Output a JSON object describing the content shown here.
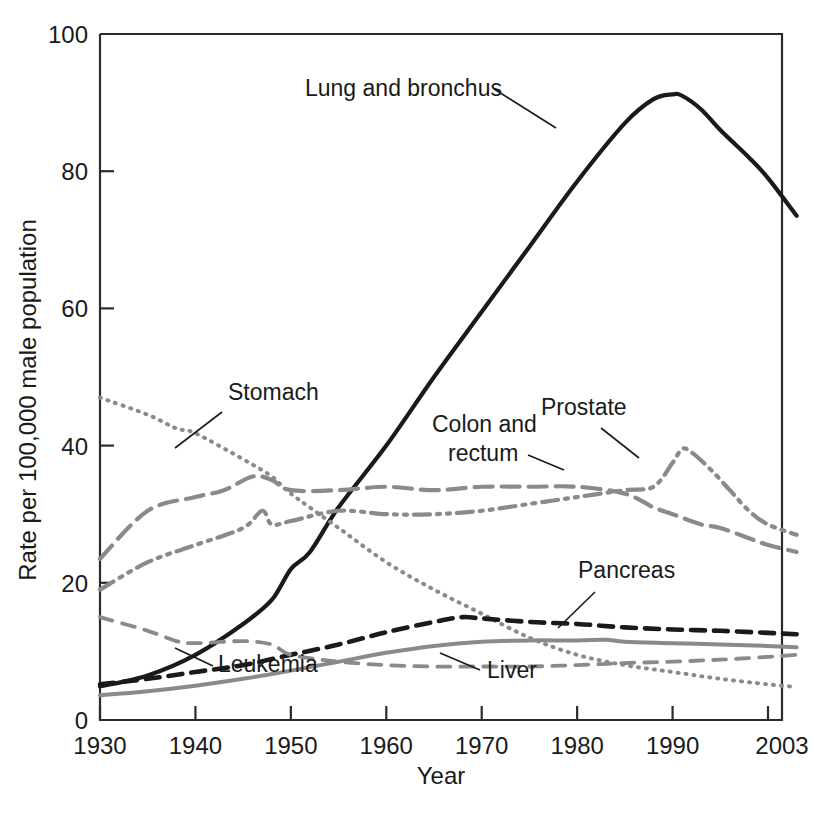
{
  "chart_data": {
    "type": "line",
    "title": "",
    "xlabel": "Year",
    "ylabel": "Rate per 100,000 male population",
    "xlim": [
      1930,
      2003
    ],
    "ylim": [
      0,
      100
    ],
    "grid": false,
    "legend_position": "inline-annotations",
    "x_ticks": [
      1930,
      1940,
      1950,
      1960,
      1970,
      1980,
      1990,
      2003
    ],
    "x_tick_labels": [
      "1930",
      "1940",
      "1950",
      "1960",
      "1970",
      "1980",
      "1990",
      "2003"
    ],
    "y_ticks": [
      0,
      20,
      40,
      60,
      80,
      100
    ],
    "y_tick_labels": [
      "0",
      "20",
      "40",
      "60",
      "80",
      "100"
    ],
    "series": [
      {
        "name": "Lung and bronchus",
        "style": "solid",
        "color": "#1a1a1a",
        "width": 4.2,
        "dash": "",
        "label_x": 305,
        "label_y": 96,
        "label_anchor": "start",
        "leader": [
          [
            494,
            89
          ],
          [
            556,
            128
          ]
        ],
        "x": [
          1930,
          1935,
          1940,
          1945,
          1948,
          1950,
          1952,
          1955,
          1960,
          1965,
          1970,
          1975,
          1980,
          1985,
          1988,
          1990,
          1991,
          1993,
          1995,
          1998,
          2000,
          2003
        ],
        "y": [
          4.9,
          6.5,
          9.5,
          14.0,
          17.5,
          22.0,
          24.5,
          31.0,
          40.0,
          50.0,
          59.5,
          69.0,
          78.5,
          87.0,
          90.5,
          91.2,
          91.0,
          89.0,
          86.0,
          82.0,
          79.0,
          73.5
        ]
      },
      {
        "name": "Stomach",
        "style": "dotted",
        "color": "#8a8a8a",
        "width": 4.0,
        "dash": "1 7",
        "label_x": 228,
        "label_y": 400,
        "label_anchor": "start",
        "leader": [
          [
            222,
            412
          ],
          [
            175,
            448
          ]
        ],
        "x": [
          1930,
          1935,
          1938,
          1940,
          1945,
          1948,
          1950,
          1955,
          1960,
          1965,
          1970,
          1975,
          1980,
          1985,
          1990,
          1995,
          2000,
          2003
        ],
        "y": [
          47.0,
          44.5,
          42.5,
          41.8,
          38.0,
          35.5,
          33.0,
          28.0,
          23.0,
          19.0,
          15.5,
          12.0,
          9.5,
          8.0,
          7.0,
          6.0,
          5.2,
          4.8
        ]
      },
      {
        "name": "Colon and rectum",
        "style": "long-dash",
        "color": "#8a8a8a",
        "width": 4.2,
        "dash": "18 9",
        "label_x": 432,
        "label_y": 432,
        "label_line2": "rectum",
        "label_anchor": "start",
        "leader": [
          [
            528,
            455
          ],
          [
            564,
            470
          ]
        ],
        "x": [
          1930,
          1935,
          1940,
          1943,
          1946,
          1948,
          1950,
          1955,
          1960,
          1965,
          1970,
          1975,
          1980,
          1985,
          1988,
          1990,
          1993,
          1995,
          1998,
          2000,
          2003
        ],
        "y": [
          23.5,
          30.5,
          32.5,
          33.5,
          35.5,
          35.0,
          33.5,
          33.5,
          34.0,
          33.5,
          34.0,
          34.0,
          34.0,
          33.0,
          31.0,
          30.0,
          28.5,
          28.0,
          26.5,
          25.5,
          24.5
        ]
      },
      {
        "name": "Prostate",
        "style": "dash-dot-dot",
        "color": "#8a8a8a",
        "width": 4.2,
        "dash": "16 7 3 7 3 7",
        "label_x": 541,
        "label_y": 415,
        "label_anchor": "start",
        "leader": [
          [
            601,
            428
          ],
          [
            639,
            458
          ]
        ],
        "x": [
          1930,
          1935,
          1940,
          1945,
          1947,
          1948,
          1950,
          1955,
          1960,
          1965,
          1970,
          1975,
          1980,
          1985,
          1988,
          1990,
          1991,
          1992,
          1994,
          1996,
          1998,
          2000,
          2003
        ],
        "y": [
          19.0,
          23.0,
          25.5,
          28.0,
          30.5,
          28.5,
          29.0,
          30.5,
          30.0,
          30.0,
          30.5,
          31.5,
          32.5,
          33.5,
          34.0,
          37.5,
          39.5,
          39.0,
          36.5,
          33.5,
          30.5,
          28.5,
          27.0
        ]
      },
      {
        "name": "Pancreas",
        "style": "dash",
        "color": "#1a1a1a",
        "width": 4.6,
        "dash": "14 9",
        "label_x": 578,
        "label_y": 578,
        "label_anchor": "start",
        "leader": [
          [
            595,
            592
          ],
          [
            558,
            628
          ]
        ],
        "x": [
          1930,
          1935,
          1940,
          1945,
          1950,
          1955,
          1960,
          1965,
          1968,
          1970,
          1975,
          1980,
          1985,
          1990,
          1995,
          2000,
          2003
        ],
        "y": [
          5.2,
          6.0,
          7.0,
          8.0,
          9.5,
          11.0,
          12.8,
          14.3,
          15.0,
          14.8,
          14.3,
          14.0,
          13.5,
          13.2,
          13.0,
          12.7,
          12.5
        ]
      },
      {
        "name": "Leukemia",
        "style": "solid",
        "color": "#8a8a8a",
        "width": 4.0,
        "dash": "",
        "label_x": 218,
        "label_y": 672,
        "label_anchor": "start",
        "leader": [
          [
            213,
            666
          ],
          [
            175,
            648
          ]
        ],
        "x": [
          1930,
          1935,
          1940,
          1945,
          1950,
          1955,
          1960,
          1965,
          1970,
          1975,
          1980,
          1983,
          1985,
          1990,
          1995,
          2000,
          2003
        ],
        "y": [
          3.6,
          4.2,
          5.0,
          6.0,
          7.2,
          8.5,
          9.8,
          10.8,
          11.4,
          11.6,
          11.6,
          11.7,
          11.4,
          11.2,
          11.0,
          10.8,
          10.6
        ]
      },
      {
        "name": "Liver",
        "style": "medium-dash",
        "color": "#8a8a8a",
        "width": 3.8,
        "dash": "13 10",
        "label_x": 487,
        "label_y": 678,
        "label_anchor": "start",
        "leader": [
          [
            480,
            670
          ],
          [
            440,
            653
          ]
        ],
        "x": [
          1930,
          1935,
          1938,
          1940,
          1945,
          1948,
          1950,
          1955,
          1960,
          1965,
          1970,
          1975,
          1980,
          1985,
          1990,
          1995,
          2000,
          2003
        ],
        "y": [
          15.0,
          13.0,
          11.5,
          11.2,
          11.5,
          11.0,
          9.5,
          8.5,
          8.0,
          7.8,
          7.8,
          7.8,
          8.0,
          8.3,
          8.5,
          8.8,
          9.2,
          9.5
        ]
      }
    ]
  },
  "axes": {
    "x_title": "Year",
    "y_title": "Rate per 100,000 male population"
  }
}
